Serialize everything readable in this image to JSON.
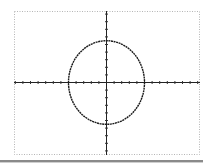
{
  "chart_data": {
    "type": "line",
    "title": "",
    "xlabel": "",
    "ylabel": "",
    "series": [
      {
        "name": "ellipse",
        "shape": "ellipse",
        "center": [
          0,
          0
        ],
        "x_radius": 5,
        "y_radius": 5.5
      }
    ],
    "xlim": [
      -12,
      12
    ],
    "ylim": [
      -8,
      9
    ],
    "x_tick_step": 1,
    "y_tick_step": 1,
    "grid": false,
    "frame": "dotted",
    "colors": {
      "curve": "#1a1a1a",
      "axes": "#222222",
      "frame": "#b5b5b5"
    }
  }
}
